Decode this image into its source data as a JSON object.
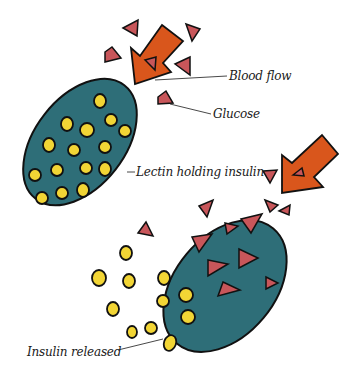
{
  "labels": {
    "blood_flow": "Blood flow",
    "glucose": "Glucose",
    "lectin": "Lectin holding insulin",
    "insulin_released": "Insulin released"
  },
  "colors": {
    "lectin": "#2e6e78",
    "insulin": "#f2d535",
    "glucose": "#c8565a",
    "arrow": "#d9561c",
    "outline": "#111111"
  }
}
